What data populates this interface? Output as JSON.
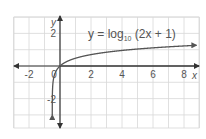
{
  "chart_data": {
    "type": "line",
    "title": "y = log10 (2x + 1)",
    "equation": {
      "prefix": "y = log",
      "subscript": "10",
      "suffix": " (2x + 1)"
    },
    "xlabel": "x",
    "ylabel": "y",
    "xlim": [
      -3,
      9
    ],
    "ylim": [
      -4,
      3
    ],
    "x_ticks": [
      -2,
      2,
      4,
      6,
      8
    ],
    "x_tick_labels": [
      "-2",
      "2",
      "4",
      "6",
      "8"
    ],
    "y_ticks": [
      2,
      -2
    ],
    "y_tick_labels": [
      "2",
      "-2"
    ],
    "origin_label": "0",
    "grid": true,
    "series": [
      {
        "name": "y = log10(2x + 1)",
        "x": [
          -0.49,
          -0.45,
          -0.4,
          -0.3,
          -0.2,
          0,
          0.5,
          1,
          2,
          3,
          4,
          5,
          6,
          7,
          8,
          8.8
        ],
        "y": [
          -1.7,
          -1.0,
          -0.7,
          -0.4,
          -0.22,
          0,
          0.3,
          0.48,
          0.7,
          0.85,
          0.95,
          1.04,
          1.11,
          1.18,
          1.23,
          1.27
        ]
      }
    ],
    "colors": {
      "grid": "#d8d8d8",
      "axis": "#333333",
      "curve": "#555555",
      "text": "#555555"
    }
  }
}
